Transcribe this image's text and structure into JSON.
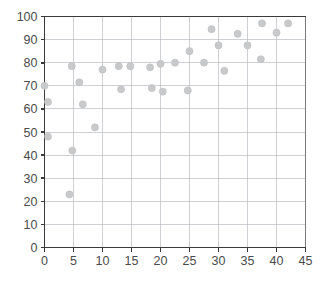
{
  "chart_data": {
    "type": "scatter",
    "title": "",
    "subtitle": "",
    "xlabel": "",
    "ylabel": "",
    "xlim": [
      0,
      45
    ],
    "ylim": [
      0,
      100
    ],
    "xticks": [
      0,
      5,
      10,
      15,
      20,
      25,
      30,
      35,
      40,
      45
    ],
    "yticks": [
      0,
      10,
      20,
      30,
      40,
      50,
      60,
      70,
      80,
      90,
      100
    ],
    "xtick_labels": [
      "0",
      "5",
      "10",
      "15",
      "20",
      "25",
      "30",
      "35",
      "40",
      "45"
    ],
    "ytick_labels": [
      "0",
      "10",
      "20",
      "30",
      "40",
      "50",
      "60",
      "70",
      "80",
      "90",
      "100"
    ],
    "grid": true,
    "legend": null,
    "legend_position": "none",
    "marker": {
      "shape": "circle",
      "color": "#c8c9cb",
      "size": 6
    },
    "series": [
      {
        "name": "series-1",
        "points": [
          {
            "x": 0.0,
            "y": 70.0
          },
          {
            "x": 0.6,
            "y": 63.0
          },
          {
            "x": 0.6,
            "y": 48.0
          },
          {
            "x": 4.3,
            "y": 23.0
          },
          {
            "x": 4.7,
            "y": 78.5
          },
          {
            "x": 4.8,
            "y": 42.0
          },
          {
            "x": 6.0,
            "y": 71.5
          },
          {
            "x": 6.6,
            "y": 62.0
          },
          {
            "x": 8.7,
            "y": 52.0
          },
          {
            "x": 10.0,
            "y": 77.0
          },
          {
            "x": 12.8,
            "y": 78.5
          },
          {
            "x": 13.2,
            "y": 68.5
          },
          {
            "x": 14.8,
            "y": 78.5
          },
          {
            "x": 18.2,
            "y": 78.0
          },
          {
            "x": 18.5,
            "y": 69.0
          },
          {
            "x": 20.0,
            "y": 79.5
          },
          {
            "x": 20.4,
            "y": 67.5
          },
          {
            "x": 22.5,
            "y": 80.0
          },
          {
            "x": 24.7,
            "y": 68.0
          },
          {
            "x": 25.0,
            "y": 85.0
          },
          {
            "x": 27.5,
            "y": 80.0
          },
          {
            "x": 28.8,
            "y": 94.5
          },
          {
            "x": 30.0,
            "y": 87.5
          },
          {
            "x": 31.0,
            "y": 76.5
          },
          {
            "x": 33.3,
            "y": 92.5
          },
          {
            "x": 35.0,
            "y": 87.5
          },
          {
            "x": 37.3,
            "y": 81.5
          },
          {
            "x": 37.5,
            "y": 97.0
          },
          {
            "x": 40.0,
            "y": 93.0
          },
          {
            "x": 42.0,
            "y": 97.0
          }
        ]
      }
    ]
  },
  "axes": {
    "y_axis_name": "y-axis",
    "x_axis_name": "x-axis"
  },
  "colors": {
    "marker": "#c8c9cb",
    "gridline": "#b9bcc2",
    "axis": "#3a3a3a",
    "tick_text": "#4a4a4a",
    "background": "#ffffff"
  }
}
